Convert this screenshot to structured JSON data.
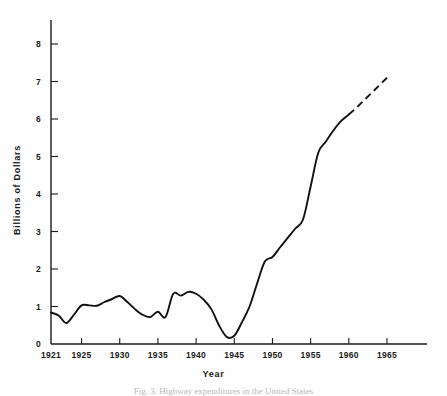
{
  "chart_data": {
    "type": "line",
    "title": "",
    "xlabel": "Year",
    "ylabel": "Billions of Dollars",
    "xlim": [
      1921,
      1969
    ],
    "ylim": [
      0,
      8.6
    ],
    "grid": false,
    "legend": null,
    "x_ticks": [
      1921,
      1925,
      1930,
      1935,
      1940,
      1945,
      1950,
      1955,
      1960,
      1965
    ],
    "x_tick_labels": [
      "1921",
      "1925",
      "1930",
      "1935",
      "1940",
      "1945",
      "1950",
      "1955",
      "1960",
      "1965"
    ],
    "y_ticks": [
      0,
      1,
      2,
      3,
      4,
      5,
      6,
      7,
      8
    ],
    "y_tick_labels": [
      "0",
      "1",
      "2",
      "3",
      "4",
      "5",
      "6",
      "7",
      "8"
    ],
    "series": [
      {
        "name": "Expenditures",
        "style": "solid",
        "x": [
          1921,
          1922,
          1923,
          1924,
          1925,
          1926,
          1927,
          1928,
          1929,
          1930,
          1931,
          1932,
          1933,
          1934,
          1935,
          1936,
          1937,
          1938,
          1939,
          1940,
          1941,
          1942,
          1943,
          1944,
          1945,
          1946,
          1947,
          1948,
          1949,
          1950,
          1951,
          1952,
          1953,
          1954,
          1955,
          1956,
          1957,
          1958,
          1959,
          1960
        ],
        "y": [
          0.84,
          0.76,
          0.56,
          0.78,
          1.03,
          1.03,
          1.02,
          1.12,
          1.2,
          1.28,
          1.12,
          0.93,
          0.78,
          0.72,
          0.86,
          0.72,
          1.34,
          1.29,
          1.39,
          1.34,
          1.18,
          0.93,
          0.5,
          0.19,
          0.22,
          0.58,
          1.0,
          1.62,
          2.2,
          2.32,
          2.58,
          2.83,
          3.08,
          3.32,
          4.2,
          5.1,
          5.4,
          5.7,
          5.95,
          6.12
        ]
      },
      {
        "name": "Projection",
        "style": "dashed",
        "x": [
          1960,
          1961,
          1962,
          1963,
          1964,
          1965,
          1965.5
        ],
        "y": [
          6.12,
          6.3,
          6.5,
          6.7,
          6.9,
          7.1,
          7.16
        ]
      }
    ]
  },
  "axis_titles": {
    "y": "Billions of Dollars",
    "x": "Year"
  },
  "caption": "Fig. 3. Highway expenditures in the United States"
}
